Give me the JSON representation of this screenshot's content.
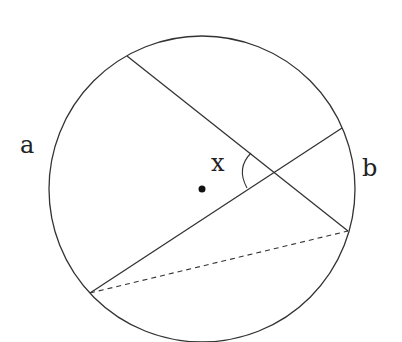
{
  "diagram": {
    "labels": {
      "a": "a",
      "b": "b",
      "x": "x"
    },
    "circle": {
      "cx": 202,
      "cy": 189,
      "r": 153
    },
    "center_point": {
      "x": 202,
      "y": 189
    },
    "chord_1": {
      "x1": 127,
      "y1": 56,
      "x2": 348,
      "y2": 231
    },
    "chord_2": {
      "x1": 90,
      "y1": 293,
      "x2": 342,
      "y2": 128
    },
    "dashed_chord": {
      "x1": 90,
      "y1": 293,
      "x2": 348,
      "y2": 231
    },
    "stroke_color": "#333333"
  }
}
